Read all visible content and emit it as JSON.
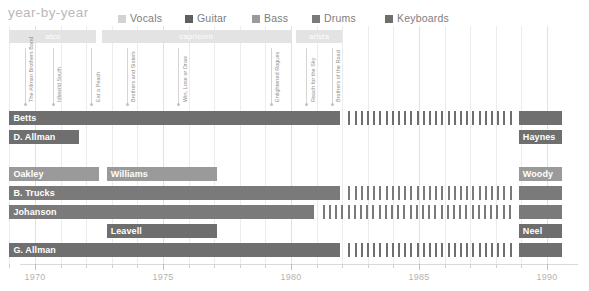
{
  "header": {
    "title": "year-by-year",
    "legend": [
      {
        "label": "Vocals",
        "color": "#d3d3d3",
        "x": 118
      },
      {
        "label": "Guitar",
        "color": "#5f5f5f",
        "x": 185
      },
      {
        "label": "Bass",
        "color": "#9a9a9a",
        "x": 252
      },
      {
        "label": "Drums",
        "color": "#7a7a7a",
        "x": 312
      },
      {
        "label": "Keyboards",
        "color": "#6e6e6e",
        "x": 385
      }
    ]
  },
  "axis": {
    "year_min": 1968.6,
    "year_max": 1990.6,
    "px_per_year": 25.6,
    "x0": 35,
    "year_labels": [
      1970,
      1975,
      1980,
      1985,
      1990
    ],
    "minor_ticks": [
      1969,
      1970,
      1971,
      1972,
      1973,
      1974,
      1975,
      1976,
      1977,
      1978,
      1979,
      1980,
      1981,
      1982,
      1983,
      1984,
      1985,
      1986,
      1987,
      1988,
      1989,
      1990
    ]
  },
  "labels": [
    {
      "name": "atco",
      "start": 1969.0,
      "end": 1972.4
    },
    {
      "name": "capricorn",
      "start": 1972.6,
      "end": 1980.0
    },
    {
      "name": "arista",
      "start": 1980.2,
      "end": 1982.0
    }
  ],
  "albums": [
    {
      "title": "The Allman Brothers Band",
      "year": 1969.6
    },
    {
      "title": "Idlewild South",
      "year": 1970.7
    },
    {
      "title": "Eat a Peach",
      "year": 1972.2
    },
    {
      "title": "Brothers and Sisters",
      "year": 1973.6
    },
    {
      "title": "Win, Lose or Draw",
      "year": 1975.6
    },
    {
      "title": "Enlightened Rogues",
      "year": 1979.2
    },
    {
      "title": "Reach for the Sky",
      "year": 1980.6
    },
    {
      "title": "Brothers of the Road",
      "year": 1981.6
    }
  ],
  "chart_data": {
    "type": "bar",
    "title": "year-by-year",
    "xlabel": "",
    "ylabel": "",
    "xlim": [
      1968.6,
      1990.6
    ],
    "grid": true,
    "legend_position": "top-right",
    "categories": [
      "Betts",
      "D. Allman",
      "Haynes",
      "Oakley",
      "Williams",
      "Woody",
      "B. Trucks",
      "Johanson",
      "Leavell",
      "Neel",
      "G. Allman"
    ],
    "rows": [
      {
        "row": 0,
        "top": 111,
        "members": [
          {
            "name": "Betts",
            "role": "Guitar",
            "color": "#6f6f6f",
            "label": true,
            "segments": [
              {
                "kind": "solid",
                "start": 1969.0,
                "end": 1981.9
              },
              {
                "kind": "hatch",
                "start": 1982.2,
                "end": 1988.7
              },
              {
                "kind": "solid",
                "start": 1988.9,
                "end": 1990.6
              }
            ]
          }
        ]
      },
      {
        "row": 1,
        "top": 130,
        "members": [
          {
            "name": "D. Allman",
            "role": "Guitar",
            "color": "#6f6f6f",
            "label": true,
            "segments": [
              {
                "kind": "solid",
                "start": 1969.0,
                "end": 1971.7
              }
            ]
          },
          {
            "name": "Haynes",
            "role": "Guitar",
            "color": "#6f6f6f",
            "label": true,
            "segments": [
              {
                "kind": "solid",
                "start": 1988.9,
                "end": 1990.6
              }
            ]
          }
        ]
      },
      {
        "row": 2,
        "top": 167,
        "members": [
          {
            "name": "Oakley",
            "role": "Bass",
            "color": "#9a9a9a",
            "label": true,
            "segments": [
              {
                "kind": "solid",
                "start": 1969.0,
                "end": 1972.5
              }
            ]
          },
          {
            "name": "Williams",
            "role": "Bass",
            "color": "#9a9a9a",
            "label": true,
            "segments": [
              {
                "kind": "solid",
                "start": 1972.8,
                "end": 1977.1
              }
            ]
          },
          {
            "name": "Woody",
            "role": "Bass",
            "color": "#9a9a9a",
            "label": true,
            "segments": [
              {
                "kind": "solid",
                "start": 1988.9,
                "end": 1990.6
              }
            ]
          }
        ]
      },
      {
        "row": 3,
        "top": 186,
        "members": [
          {
            "name": "B. Trucks",
            "role": "Drums",
            "color": "#7a7a7a",
            "label": true,
            "segments": [
              {
                "kind": "solid",
                "start": 1969.0,
                "end": 1981.9
              },
              {
                "kind": "hatch",
                "start": 1982.2,
                "end": 1988.7
              },
              {
                "kind": "solid",
                "start": 1988.9,
                "end": 1990.6
              }
            ]
          }
        ]
      },
      {
        "row": 4,
        "top": 205,
        "members": [
          {
            "name": "Johanson",
            "role": "Drums",
            "color": "#7a7a7a",
            "label": true,
            "segments": [
              {
                "kind": "solid",
                "start": 1969.0,
                "end": 1980.9
              },
              {
                "kind": "hatch",
                "start": 1981.2,
                "end": 1988.7
              },
              {
                "kind": "solid",
                "start": 1988.9,
                "end": 1990.6
              }
            ]
          }
        ]
      },
      {
        "row": 5,
        "top": 224,
        "members": [
          {
            "name": "Leavell",
            "role": "Keyboards",
            "color": "#6e6e6e",
            "label": true,
            "segments": [
              {
                "kind": "solid",
                "start": 1972.8,
                "end": 1977.1
              }
            ]
          },
          {
            "name": "Neel",
            "role": "Keyboards",
            "color": "#6e6e6e",
            "label": true,
            "segments": [
              {
                "kind": "solid",
                "start": 1988.9,
                "end": 1990.6
              }
            ]
          }
        ]
      },
      {
        "row": 6,
        "top": 243,
        "members": [
          {
            "name": "G. Allman",
            "role": "Vocals",
            "color": "#6f6f6f",
            "label": true,
            "segments": [
              {
                "kind": "solid",
                "start": 1969.0,
                "end": 1981.9
              },
              {
                "kind": "hatch",
                "start": 1982.2,
                "end": 1988.7
              },
              {
                "kind": "solid",
                "start": 1988.9,
                "end": 1990.6
              }
            ]
          }
        ]
      }
    ]
  }
}
